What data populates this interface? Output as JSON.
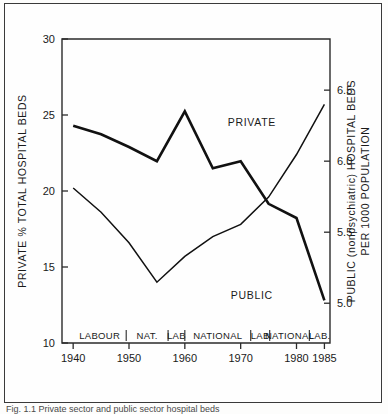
{
  "figure": {
    "caption": "Fig. 1.1  Private sector and  public sector hospital beds"
  },
  "chart_data": {
    "type": "line",
    "title": "",
    "xlabel": "",
    "xlim": [
      1938,
      1986
    ],
    "xticks": [
      1940,
      1950,
      1960,
      1970,
      1980,
      1985
    ],
    "xticklabels": [
      "1940",
      "1950",
      "1960",
      "1970",
      "1980",
      "1985"
    ],
    "grid": false,
    "legend": "inline-annotation",
    "left_axis": {
      "label": "PRIVATE % TOTAL HOSPITAL BEDS",
      "ylim": [
        10,
        30
      ],
      "yticks": [
        10,
        15,
        20,
        25,
        30
      ],
      "yticklabels": [
        "10",
        "15",
        "20",
        "25",
        "30"
      ]
    },
    "right_axis": {
      "label": "PUBLIC (nonpsychiatric) HOSPITAL BEDS PER 1000 POPULATION",
      "ylim": [
        4.72,
        6.86
      ],
      "yticks": [
        5.0,
        5.5,
        6.0,
        6.5
      ],
      "yticklabels": [
        "5.0",
        "5.5",
        "6.0",
        "6.5"
      ]
    },
    "series": [
      {
        "name": "PRIVATE",
        "axis": "left",
        "style": "thin",
        "x": [
          1940,
          1945,
          1950,
          1955,
          1960,
          1965,
          1970,
          1975,
          1980,
          1985
        ],
        "values": [
          20.2,
          18.6,
          16.6,
          14.0,
          15.7,
          17.0,
          17.8,
          19.6,
          22.4,
          25.7
        ]
      },
      {
        "name": "PUBLIC",
        "axis": "right",
        "style": "thick",
        "x": [
          1940,
          1945,
          1950,
          1955,
          1960,
          1965,
          1970,
          1975,
          1980,
          1985
        ],
        "values": [
          6.25,
          6.19,
          6.1,
          6.0,
          6.35,
          5.95,
          6.0,
          5.7,
          5.6,
          5.02
        ],
        "left_scale_equivalent": [
          22.2,
          21.9,
          21.0,
          19.95,
          23.3,
          19.45,
          19.9,
          16.6,
          15.5,
          10.05
        ]
      }
    ],
    "annotations": [
      {
        "text": "PRIVATE",
        "x": 1972,
        "y_left": 24.3
      },
      {
        "text": "PUBLIC",
        "x": 1972,
        "y_left": 12.9
      }
    ],
    "government_bands": [
      {
        "label": "LABOUR",
        "start": 1940,
        "end": 1949.5
      },
      {
        "label": "NAT.",
        "start": 1949.5,
        "end": 1957.0
      },
      {
        "label": "LAB",
        "start": 1957.0,
        "end": 1960.0
      },
      {
        "label": "NATIONAL",
        "start": 1960.0,
        "end": 1971.8
      },
      {
        "label": "LAB",
        "start": 1971.8,
        "end": 1975.2
      },
      {
        "label": "NATIONAL",
        "start": 1975.2,
        "end": 1982.3
      },
      {
        "label": "LAB.",
        "start": 1982.3,
        "end": 1986.0
      }
    ]
  }
}
